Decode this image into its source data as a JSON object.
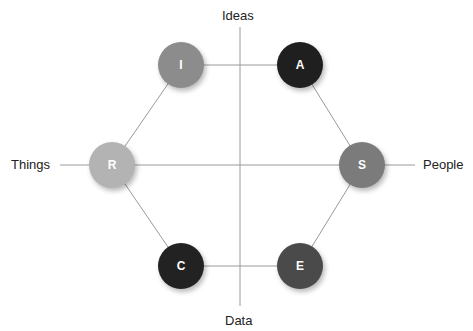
{
  "diagram": {
    "type": "hexagon-model",
    "axes": {
      "top": "Ideas",
      "bottom": "Data",
      "left": "Things",
      "right": "People"
    },
    "nodes": [
      {
        "id": "R",
        "label": "R",
        "color": "#b3b3b3"
      },
      {
        "id": "I",
        "label": "I",
        "color": "#8c8c8c"
      },
      {
        "id": "A",
        "label": "A",
        "color": "#1f1f1f"
      },
      {
        "id": "S",
        "label": "S",
        "color": "#7b7b7b"
      },
      {
        "id": "E",
        "label": "E",
        "color": "#4a4a4a"
      },
      {
        "id": "C",
        "label": "C",
        "color": "#222222"
      }
    ],
    "edges": [
      [
        "R",
        "I"
      ],
      [
        "I",
        "A"
      ],
      [
        "A",
        "S"
      ],
      [
        "S",
        "E"
      ],
      [
        "E",
        "C"
      ],
      [
        "C",
        "R"
      ]
    ]
  }
}
